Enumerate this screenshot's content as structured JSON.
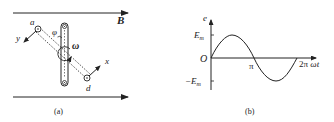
{
  "figure_a": {
    "caption": "(a)",
    "field_label": "B",
    "point_a": "a",
    "point_d": "d",
    "axis_x": "x",
    "axis_y": "y",
    "angle_label": "φ",
    "angular_velocity": "ω"
  },
  "figure_b": {
    "caption": "(b)",
    "y_axis_label": "e",
    "x_axis_label": "ωt",
    "origin_label": "O",
    "pos_max_label": "Em",
    "neg_max_label": "−Em",
    "pi_label": "π",
    "two_pi_label": "2π"
  },
  "colors": {
    "line": "#222222",
    "background": "#ffffff"
  }
}
